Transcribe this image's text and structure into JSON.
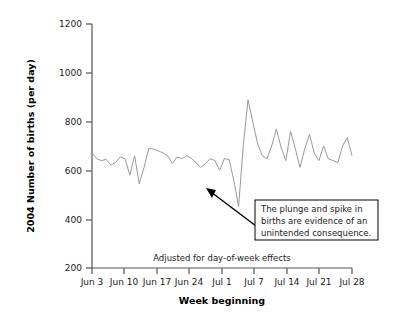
{
  "chart_data": {
    "type": "line",
    "title": "",
    "xlabel": "Week beginning",
    "ylabel": "2004 Number of births (per day)",
    "ylim": [
      200,
      1200
    ],
    "yticks": [
      200,
      400,
      600,
      800,
      1000,
      1200
    ],
    "ytick_labels": [
      "200",
      "400",
      "600",
      "800",
      "1000",
      "1200"
    ],
    "xtick_labels": [
      "Jun 3",
      "Jun 10",
      "Jun 17",
      "Jun 24",
      "Jul 1",
      "Jul 7",
      "Jul 14",
      "Jul 21",
      "Jul 28"
    ],
    "grid": false,
    "legend": false,
    "line_color": "#999999",
    "series": [
      {
        "name": "Births per day (adjusted)",
        "x": [
          0,
          1,
          2,
          3,
          4,
          5,
          6,
          7,
          8,
          9,
          10,
          11,
          12,
          13,
          14,
          15,
          16,
          17,
          18,
          19,
          20,
          21,
          22,
          23,
          24,
          25,
          26,
          27,
          28,
          29,
          30,
          31,
          32,
          33,
          34,
          35,
          36,
          37,
          38,
          39,
          40,
          41,
          42,
          43,
          44,
          45,
          46,
          47,
          48,
          49,
          50,
          51,
          52,
          53,
          54,
          55
        ],
        "values": [
          672,
          648,
          640,
          645,
          622,
          632,
          655,
          648,
          580,
          660,
          545,
          612,
          690,
          688,
          680,
          672,
          660,
          628,
          655,
          648,
          660,
          650,
          632,
          612,
          628,
          648,
          640,
          600,
          648,
          645,
          560,
          452,
          700,
          890,
          800,
          712,
          660,
          648,
          700,
          770,
          695,
          640,
          760,
          690,
          612,
          688,
          748,
          672,
          640,
          700,
          648,
          640,
          632,
          700,
          735,
          660
        ]
      }
    ],
    "annotations": [
      {
        "name": "plunge-spike-callout",
        "text_lines": [
          "The plunge and spike in",
          "births are evidence of an",
          "unintended consequence."
        ],
        "has_arrow": true
      },
      {
        "name": "adjustment-note",
        "text": "Adjusted for day-of-week effects"
      }
    ]
  },
  "axes": {
    "ylabel": "2004 Number of births (per day)",
    "xlabel": "Week beginning",
    "ytick_labels": [
      "1200",
      "1000",
      "800",
      "600",
      "400",
      "200"
    ],
    "xtick_labels": [
      "Jun 3",
      "Jun 10",
      "Jun 17",
      "Jun 24",
      "Jul 1",
      "Jul 7",
      "Jul 14",
      "Jul 21",
      "Jul 28"
    ]
  },
  "callout": {
    "line1": "The plunge and spike in",
    "line2": "births are evidence of an",
    "line3": "unintended consequence."
  },
  "footnote": {
    "text": "Adjusted for day-of-week effects"
  },
  "colors": {
    "line": "#999999",
    "axis": "#555555",
    "text": "#1a1a1a",
    "box_border": "#000000",
    "background": "#ffffff"
  }
}
